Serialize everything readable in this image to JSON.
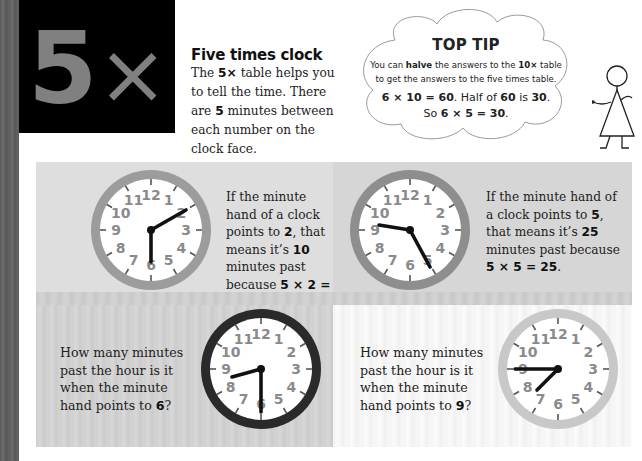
{
  "hero": {
    "number": "5",
    "symbol": "×"
  },
  "intro": {
    "title": "Five times clock",
    "body": [
      {
        "text": "The ",
        "bold": false
      },
      {
        "text": "5×",
        "bold": true
      },
      {
        "text": " table helps you to tell the time. There are ",
        "bold": false
      },
      {
        "text": "5",
        "bold": true
      },
      {
        "text": " minutes between each number on the clock face.",
        "bold": false
      }
    ]
  },
  "top_tip": {
    "title": "TOP TIP",
    "line1_a": "You can ",
    "line1_b": "halve",
    "line1_c": " the answers to the ",
    "line1_d": "10×",
    "line1_e": " table",
    "line2": "to get the answers to the five times table.",
    "eq1_a": "6 × 10 = 60",
    "eq1_b": ". Half of ",
    "eq1_c": "60",
    "eq1_d": " is ",
    "eq1_e": "30",
    "eq1_f": ".",
    "eq2_a": "So ",
    "eq2_b": "6 × 5 = 30",
    "eq2_c": "."
  },
  "clock_numbers": [
    "12",
    "1",
    "2",
    "3",
    "4",
    "5",
    "6",
    "7",
    "8",
    "9",
    "10",
    "11"
  ],
  "panels": [
    {
      "id": "example-2",
      "rim_color": "#9c9c9c",
      "hour_angle": 180,
      "minute_angle": 60,
      "t1": "If the minute hand of a clock points to ",
      "t2": "2",
      "t3": ", that means it’s ",
      "t4": "10",
      "t5": " minutes past because ",
      "t6": "5 × 2 = 10",
      "t7": "."
    },
    {
      "id": "example-5",
      "rim_color": "#8e8e8e",
      "hour_angle": 282,
      "minute_angle": 150,
      "t1": "If the minute hand of a clock points to ",
      "t2": "5",
      "t3": ", that means it’s ",
      "t4": "25",
      "t5": " minutes past because ",
      "t6": "5 × 5 = 25",
      "t7": "."
    },
    {
      "id": "question-6",
      "rim_color": "#2a2a2a",
      "hour_angle": 255,
      "minute_angle": 180,
      "q1": "How many minutes past the hour is it when the minute hand points to ",
      "q2": "6",
      "q3": "?"
    },
    {
      "id": "question-9",
      "rim_color": "#c8c8c8",
      "hour_angle": 218,
      "minute_angle": 270,
      "q1": "How many minutes past the hour is it when the minute hand points to ",
      "q2": "9",
      "q3": "?"
    }
  ]
}
